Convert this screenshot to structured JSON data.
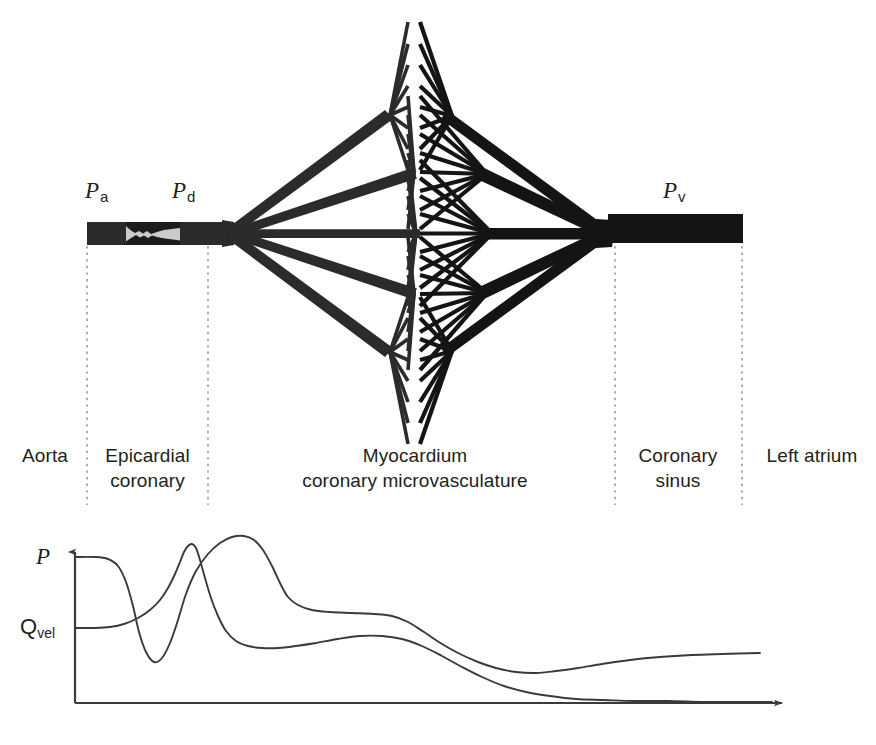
{
  "figure": {
    "ink_color": "#231f20",
    "vessel_color": "#2b2b2b",
    "plaque_color": "#1c1c1c",
    "lumen_color": "#c9cbcd",
    "divider_color": "#8d8d8d",
    "curve_color": "#3a3a3a"
  },
  "anatomy": {
    "pressure_labels": [
      {
        "id": "pa",
        "symbol": "P",
        "subscript": "a",
        "x": 85,
        "y": 178
      },
      {
        "id": "pd",
        "symbol": "P",
        "subscript": "d",
        "x": 172,
        "y": 178
      },
      {
        "id": "pv",
        "symbol": "P",
        "subscript": "v",
        "x": 663,
        "y": 178
      }
    ],
    "zones": [
      {
        "id": "aorta",
        "line1": "Aorta",
        "line2": "",
        "x": 5,
        "width": 80,
        "y": 443
      },
      {
        "id": "epicardial",
        "line1": "Epicardial",
        "line2": "coronary",
        "x": 95,
        "width": 105,
        "y": 443
      },
      {
        "id": "myocardium",
        "line1": "Myocardium",
        "line2": "coronary microvasculature",
        "x": 260,
        "width": 310,
        "y": 443
      },
      {
        "id": "coronary-sinus",
        "line1": "Coronary",
        "line2": "sinus",
        "x": 622,
        "width": 112,
        "y": 443
      },
      {
        "id": "left-atrium",
        "line1": "Left atrium",
        "line2": "",
        "x": 752,
        "width": 120,
        "y": 443
      }
    ],
    "dividers": [
      {
        "id": "divider-aorta-epicardial",
        "x": 87,
        "y1": 246,
        "y2": 505
      },
      {
        "id": "divider-epicardial-myo",
        "x": 208,
        "y1": 246,
        "y2": 505
      },
      {
        "id": "divider-myo-sinus",
        "x": 615,
        "y1": 246,
        "y2": 505
      },
      {
        "id": "divider-sinus-atrium",
        "x": 742,
        "y1": 246,
        "y2": 505
      }
    ]
  },
  "chart_data": {
    "type": "line",
    "title": "",
    "xlabel": "",
    "ylabel": "",
    "grid": false,
    "legend": "inline-left",
    "axes": {
      "origin_x": 75,
      "origin_y": 703,
      "x_end": 790,
      "y_top": 545,
      "x_arrow": true,
      "y_arrow": true
    },
    "series": [
      {
        "name": "P",
        "label": "P",
        "label_sub": "",
        "label_x": 36,
        "label_y": 544,
        "description": "Aortic/coronary pressure: high plateau, sharp drop across stenosis, rebound peak, decay to trough, slight recovery",
        "points": [
          [
            75,
            557
          ],
          [
            95,
            557
          ],
          [
            108,
            559
          ],
          [
            118,
            566
          ],
          [
            126,
            582
          ],
          [
            133,
            606
          ],
          [
            139,
            632
          ],
          [
            146,
            652
          ],
          [
            154,
            662
          ],
          [
            162,
            658
          ],
          [
            170,
            643
          ],
          [
            178,
            620
          ],
          [
            186,
            594
          ],
          [
            196,
            571
          ],
          [
            208,
            554
          ],
          [
            220,
            543
          ],
          [
            232,
            537
          ],
          [
            244,
            536
          ],
          [
            254,
            540
          ],
          [
            263,
            550
          ],
          [
            272,
            566
          ],
          [
            280,
            583
          ],
          [
            288,
            597
          ],
          [
            298,
            605
          ],
          [
            312,
            610
          ],
          [
            330,
            612
          ],
          [
            352,
            613
          ],
          [
            374,
            614
          ],
          [
            392,
            616
          ],
          [
            408,
            622
          ],
          [
            424,
            632
          ],
          [
            442,
            644
          ],
          [
            460,
            654
          ],
          [
            478,
            662
          ],
          [
            496,
            668
          ],
          [
            516,
            672
          ],
          [
            536,
            673
          ],
          [
            556,
            671
          ],
          [
            578,
            668
          ],
          [
            602,
            664
          ],
          [
            630,
            660
          ],
          [
            660,
            657
          ],
          [
            692,
            655
          ],
          [
            722,
            654
          ],
          [
            760,
            653
          ]
        ]
      },
      {
        "name": "Qvel",
        "label": "Q",
        "label_sub": "vel",
        "label_x": 20,
        "label_y": 617,
        "description": "Coronary flow velocity: modest plateau, rise crossing pressure, broad peak, long decay toward baseline",
        "points": [
          [
            75,
            628
          ],
          [
            95,
            628
          ],
          [
            110,
            627
          ],
          [
            124,
            624
          ],
          [
            138,
            618
          ],
          [
            150,
            610
          ],
          [
            160,
            600
          ],
          [
            168,
            588
          ],
          [
            175,
            574
          ],
          [
            180,
            562
          ],
          [
            184,
            552
          ],
          [
            188,
            546
          ],
          [
            192,
            544
          ],
          [
            196,
            548
          ],
          [
            200,
            560
          ],
          [
            205,
            578
          ],
          [
            211,
            598
          ],
          [
            218,
            616
          ],
          [
            226,
            631
          ],
          [
            236,
            641
          ],
          [
            248,
            646
          ],
          [
            262,
            648
          ],
          [
            278,
            648
          ],
          [
            296,
            646
          ],
          [
            316,
            643
          ],
          [
            338,
            639
          ],
          [
            360,
            636
          ],
          [
            382,
            636
          ],
          [
            402,
            639
          ],
          [
            422,
            646
          ],
          [
            442,
            656
          ],
          [
            462,
            667
          ],
          [
            482,
            677
          ],
          [
            504,
            686
          ],
          [
            526,
            692
          ],
          [
            550,
            696
          ],
          [
            576,
            699
          ],
          [
            604,
            700
          ],
          [
            634,
            701
          ],
          [
            668,
            701
          ],
          [
            704,
            702
          ],
          [
            740,
            702
          ],
          [
            772,
            702
          ]
        ]
      }
    ]
  }
}
